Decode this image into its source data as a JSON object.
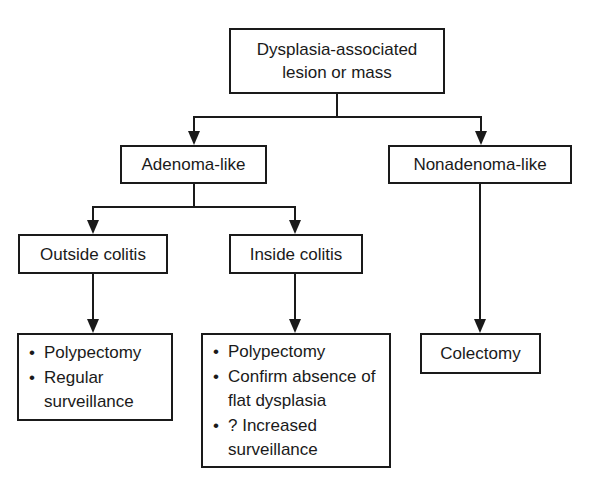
{
  "diagram": {
    "type": "flowchart",
    "root": {
      "label_line1": "Dysplasia-associated",
      "label_line2": "lesion or mass"
    },
    "level2": {
      "adenoma_like": "Adenoma-like",
      "nonadenoma_like": "Nonadenoma-like"
    },
    "level3": {
      "outside_colitis": "Outside colitis",
      "inside_colitis": "Inside colitis"
    },
    "outcomes": {
      "outside": {
        "items": [
          "Polypectomy",
          "Regular surveillance"
        ]
      },
      "inside": {
        "items": [
          "Polypectomy",
          "Confirm absence of flat dysplasia",
          "? Increased surveillance"
        ]
      },
      "nonadenoma": {
        "label": "Colectomy"
      }
    },
    "edges": [
      {
        "from": "Dysplasia-associated lesion or mass",
        "to": "Adenoma-like"
      },
      {
        "from": "Dysplasia-associated lesion or mass",
        "to": "Nonadenoma-like"
      },
      {
        "from": "Adenoma-like",
        "to": "Outside colitis"
      },
      {
        "from": "Adenoma-like",
        "to": "Inside colitis"
      },
      {
        "from": "Outside colitis",
        "to": "Polypectomy / Regular surveillance"
      },
      {
        "from": "Inside colitis",
        "to": "Polypectomy / Confirm absence of flat dysplasia / ? Increased surveillance"
      },
      {
        "from": "Nonadenoma-like",
        "to": "Colectomy"
      }
    ],
    "colors": {
      "line": "#1a1a1a",
      "background": "#ffffff"
    }
  }
}
